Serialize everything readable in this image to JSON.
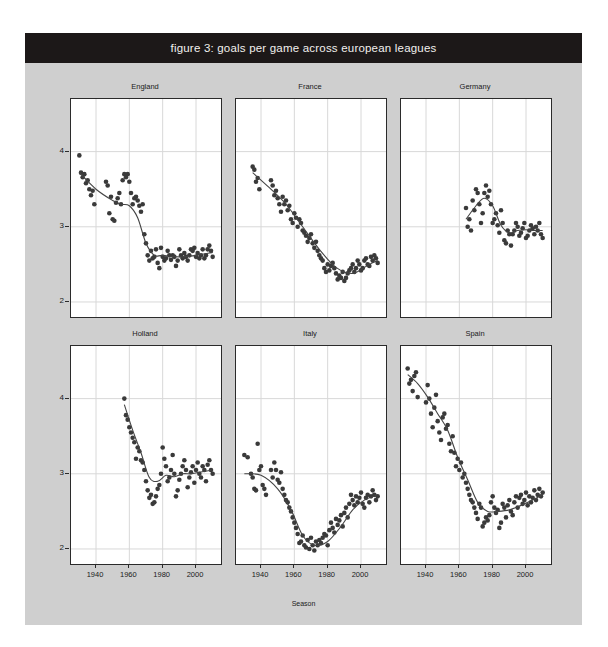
{
  "figure": {
    "title": "figure 3: goals per game across european leagues",
    "background_color": "#cfcfcf",
    "title_bar_color": "#1c1818",
    "title_text_color": "#f2f0ee",
    "panel_background": "#ffffff",
    "panel_border_color": "#2b2b2b",
    "grid_color": "#d8d8d8",
    "point_color": "#3a3a3a",
    "trend_line_color": "#444444"
  },
  "axes": {
    "xlabel": "Season",
    "ylabel": "Average goals per game",
    "yticks": [
      "4",
      "3",
      "2"
    ],
    "ytick_values": [
      4,
      3,
      2
    ],
    "xticks": [
      "1940",
      "1960",
      "1980",
      "2000"
    ],
    "xtick_values": [
      1940,
      1960,
      1980,
      2000
    ],
    "xlim": [
      1925,
      2015
    ],
    "ylim": [
      1.8,
      4.7
    ],
    "grid": true,
    "grid_axis": "both"
  },
  "panel_labels": [
    "England",
    "France",
    "Germany",
    "Holland",
    "Italy",
    "Spain"
  ],
  "chart_data": {
    "type": "scatter",
    "title": "figure 3: goals per game across european leagues",
    "xlabel": "Season",
    "ylabel": "Average goals per game",
    "xlim": [
      1925,
      2015
    ],
    "ylim": [
      1.8,
      4.7
    ],
    "xticks": [
      1940,
      1960,
      1980,
      2000
    ],
    "yticks": [
      2,
      3,
      4
    ],
    "grid": true,
    "legend": "none",
    "facet_layout": [
      3,
      2
    ],
    "series": [
      {
        "name": "England",
        "row": 0,
        "col": 0,
        "x": [
          1930,
          1931,
          1932,
          1933,
          1934,
          1935,
          1936,
          1937,
          1938,
          1939,
          1946,
          1947,
          1948,
          1949,
          1950,
          1951,
          1952,
          1953,
          1954,
          1955,
          1956,
          1957,
          1958,
          1959,
          1960,
          1961,
          1962,
          1963,
          1964,
          1965,
          1966,
          1967,
          1968,
          1969,
          1970,
          1971,
          1972,
          1973,
          1974,
          1975,
          1976,
          1977,
          1978,
          1979,
          1980,
          1981,
          1982,
          1983,
          1984,
          1985,
          1986,
          1987,
          1988,
          1989,
          1990,
          1991,
          1992,
          1993,
          1994,
          1995,
          1996,
          1997,
          1998,
          1999,
          2000,
          2001,
          2002,
          2003,
          2004,
          2005,
          2006,
          2007,
          2008,
          2009,
          2010
        ],
        "y": [
          3.95,
          3.72,
          3.66,
          3.7,
          3.58,
          3.62,
          3.5,
          3.42,
          3.48,
          3.3,
          3.6,
          3.55,
          3.18,
          3.4,
          3.1,
          3.08,
          3.32,
          3.38,
          3.45,
          3.3,
          3.62,
          3.7,
          3.66,
          3.7,
          3.6,
          3.45,
          3.3,
          3.38,
          3.4,
          3.35,
          3.28,
          3.2,
          3.3,
          2.9,
          2.78,
          2.62,
          2.55,
          2.68,
          2.58,
          2.6,
          2.7,
          2.52,
          2.45,
          2.72,
          2.6,
          2.55,
          2.58,
          2.68,
          2.62,
          2.56,
          2.62,
          2.6,
          2.48,
          2.55,
          2.7,
          2.62,
          2.58,
          2.65,
          2.6,
          2.55,
          2.62,
          2.7,
          2.68,
          2.72,
          2.6,
          2.65,
          2.58,
          2.62,
          2.7,
          2.58,
          2.62,
          2.7,
          2.75,
          2.68,
          2.6
        ],
        "trend": {
          "x": [
            1930,
            1940,
            1950,
            1955,
            1960,
            1965,
            1970,
            1975,
            1980,
            1990,
            2000,
            2010
          ],
          "y": [
            3.72,
            3.5,
            3.35,
            3.3,
            3.28,
            3.12,
            2.78,
            2.62,
            2.62,
            2.6,
            2.62,
            2.66
          ]
        }
      },
      {
        "name": "France",
        "row": 0,
        "col": 1,
        "x": [
          1935,
          1936,
          1937,
          1938,
          1939,
          1946,
          1947,
          1948,
          1949,
          1950,
          1951,
          1952,
          1953,
          1954,
          1955,
          1956,
          1957,
          1958,
          1959,
          1960,
          1961,
          1962,
          1963,
          1964,
          1965,
          1966,
          1967,
          1968,
          1969,
          1970,
          1971,
          1972,
          1973,
          1974,
          1975,
          1976,
          1977,
          1978,
          1979,
          1980,
          1981,
          1982,
          1983,
          1984,
          1985,
          1986,
          1987,
          1988,
          1989,
          1990,
          1991,
          1992,
          1993,
          1994,
          1995,
          1996,
          1997,
          1998,
          1999,
          2000,
          2001,
          2002,
          2003,
          2004,
          2005,
          2006,
          2007,
          2008,
          2009,
          2010
        ],
        "y": [
          3.8,
          3.76,
          3.6,
          3.65,
          3.5,
          3.62,
          3.55,
          3.42,
          3.48,
          3.38,
          3.3,
          3.2,
          3.4,
          3.3,
          3.35,
          3.22,
          3.28,
          3.1,
          3.05,
          3.18,
          3.12,
          3.0,
          3.1,
          3.05,
          2.95,
          2.92,
          2.88,
          2.8,
          2.85,
          2.9,
          2.78,
          2.72,
          2.8,
          2.68,
          2.62,
          2.58,
          2.55,
          2.45,
          2.4,
          2.5,
          2.42,
          2.48,
          2.52,
          2.45,
          2.38,
          2.3,
          2.35,
          2.32,
          2.4,
          2.28,
          2.32,
          2.38,
          2.42,
          2.45,
          2.5,
          2.4,
          2.45,
          2.55,
          2.5,
          2.42,
          2.45,
          2.55,
          2.58,
          2.5,
          2.48,
          2.6,
          2.55,
          2.62,
          2.58,
          2.52
        ],
        "trend": {
          "x": [
            1935,
            1945,
            1955,
            1965,
            1975,
            1985,
            1995,
            2005,
            2010
          ],
          "y": [
            3.72,
            3.52,
            3.3,
            3.0,
            2.7,
            2.46,
            2.38,
            2.5,
            2.55
          ]
        }
      },
      {
        "name": "Germany",
        "row": 0,
        "col": 2,
        "x": [
          1964,
          1965,
          1966,
          1967,
          1968,
          1969,
          1970,
          1971,
          1972,
          1973,
          1974,
          1975,
          1976,
          1977,
          1978,
          1979,
          1980,
          1981,
          1982,
          1983,
          1984,
          1985,
          1986,
          1987,
          1988,
          1989,
          1990,
          1991,
          1992,
          1993,
          1994,
          1995,
          1996,
          1997,
          1998,
          1999,
          2000,
          2001,
          2002,
          2003,
          2004,
          2005,
          2006,
          2007,
          2008,
          2009,
          2010
        ],
        "y": [
          3.25,
          3.0,
          3.1,
          2.95,
          3.35,
          3.22,
          3.5,
          3.45,
          3.3,
          3.05,
          3.18,
          3.45,
          3.55,
          3.4,
          3.48,
          3.3,
          3.05,
          3.1,
          3.18,
          3.02,
          2.92,
          3.22,
          3.05,
          2.82,
          2.78,
          2.95,
          2.9,
          2.75,
          2.9,
          2.95,
          3.05,
          3.0,
          2.88,
          2.92,
          2.98,
          3.05,
          2.85,
          2.88,
          2.95,
          3.02,
          2.98,
          2.9,
          3.0,
          2.95,
          3.05,
          2.9,
          2.85
        ],
        "trend": {
          "x": [
            1964,
            1970,
            1975,
            1980,
            1985,
            1990,
            1995,
            2000,
            2005,
            2010
          ],
          "y": [
            3.1,
            3.28,
            3.38,
            3.28,
            3.02,
            2.92,
            2.95,
            2.96,
            2.95,
            2.95
          ]
        }
      },
      {
        "name": "Holland",
        "row": 1,
        "col": 0,
        "x": [
          1957,
          1958,
          1959,
          1960,
          1961,
          1962,
          1963,
          1964,
          1965,
          1966,
          1967,
          1968,
          1969,
          1970,
          1971,
          1972,
          1973,
          1974,
          1975,
          1976,
          1977,
          1978,
          1979,
          1980,
          1981,
          1982,
          1983,
          1984,
          1985,
          1986,
          1987,
          1988,
          1989,
          1990,
          1991,
          1992,
          1993,
          1994,
          1995,
          1996,
          1997,
          1998,
          1999,
          2000,
          2001,
          2002,
          2003,
          2004,
          2005,
          2006,
          2007,
          2008,
          2009,
          2010
        ],
        "y": [
          4.0,
          3.78,
          3.72,
          3.62,
          3.55,
          3.48,
          3.42,
          3.2,
          3.35,
          3.3,
          3.18,
          3.15,
          3.05,
          2.9,
          2.78,
          2.68,
          2.72,
          2.6,
          2.62,
          2.7,
          2.8,
          2.85,
          3.0,
          3.35,
          3.2,
          3.1,
          2.9,
          2.95,
          3.05,
          3.25,
          3.0,
          2.7,
          2.78,
          2.92,
          3.0,
          3.1,
          3.18,
          3.05,
          2.82,
          2.95,
          3.02,
          3.1,
          2.88,
          3.05,
          3.15,
          3.0,
          2.95,
          3.1,
          3.05,
          2.9,
          3.12,
          3.18,
          3.05,
          3.0
        ],
        "trend": {
          "x": [
            1957,
            1962,
            1967,
            1972,
            1977,
            1982,
            1987,
            1992,
            1997,
            2002,
            2010
          ],
          "y": [
            3.92,
            3.58,
            3.28,
            2.95,
            2.9,
            2.98,
            2.96,
            3.0,
            3.0,
            3.02,
            3.05
          ]
        }
      },
      {
        "name": "Italy",
        "row": 1,
        "col": 1,
        "x": [
          1930,
          1932,
          1934,
          1935,
          1936,
          1937,
          1938,
          1939,
          1940,
          1941,
          1942,
          1943,
          1946,
          1947,
          1948,
          1949,
          1950,
          1951,
          1952,
          1953,
          1954,
          1955,
          1956,
          1957,
          1958,
          1959,
          1960,
          1961,
          1962,
          1963,
          1964,
          1965,
          1966,
          1967,
          1968,
          1969,
          1970,
          1971,
          1972,
          1973,
          1974,
          1975,
          1976,
          1977,
          1978,
          1979,
          1980,
          1981,
          1982,
          1983,
          1984,
          1985,
          1986,
          1987,
          1988,
          1989,
          1990,
          1991,
          1992,
          1993,
          1994,
          1995,
          1996,
          1997,
          1998,
          1999,
          2000,
          2001,
          2002,
          2003,
          2004,
          2005,
          2006,
          2007,
          2008,
          2009,
          2010
        ],
        "y": [
          3.25,
          3.22,
          3.0,
          2.95,
          2.8,
          2.78,
          3.4,
          3.05,
          3.1,
          2.85,
          2.8,
          2.72,
          3.05,
          2.95,
          3.15,
          3.05,
          2.92,
          2.88,
          3.02,
          2.8,
          2.72,
          2.65,
          2.62,
          2.55,
          2.5,
          2.42,
          2.35,
          2.28,
          2.2,
          2.08,
          2.1,
          2.18,
          2.05,
          2.02,
          2.12,
          2.0,
          2.15,
          2.05,
          1.98,
          2.1,
          2.05,
          2.12,
          2.08,
          2.15,
          2.2,
          2.18,
          2.05,
          2.25,
          2.35,
          2.28,
          2.22,
          2.4,
          2.32,
          2.38,
          2.45,
          2.3,
          2.48,
          2.55,
          2.42,
          2.6,
          2.72,
          2.65,
          2.58,
          2.7,
          2.62,
          2.68,
          2.75,
          2.6,
          2.55,
          2.68,
          2.72,
          2.62,
          2.7,
          2.78,
          2.72,
          2.65,
          2.7
        ],
        "trend": {
          "x": [
            1930,
            1940,
            1950,
            1958,
            1965,
            1972,
            1980,
            1988,
            1995,
            2002,
            2010
          ],
          "y": [
            3.0,
            2.98,
            2.8,
            2.52,
            2.18,
            2.05,
            2.1,
            2.3,
            2.52,
            2.65,
            2.72
          ]
        }
      },
      {
        "name": "Spain",
        "row": 1,
        "col": 2,
        "x": [
          1929,
          1930,
          1931,
          1932,
          1933,
          1934,
          1935,
          1940,
          1941,
          1942,
          1943,
          1944,
          1945,
          1946,
          1947,
          1948,
          1949,
          1950,
          1951,
          1952,
          1953,
          1954,
          1955,
          1956,
          1957,
          1958,
          1959,
          1960,
          1961,
          1962,
          1963,
          1964,
          1965,
          1966,
          1967,
          1968,
          1969,
          1970,
          1971,
          1972,
          1973,
          1974,
          1975,
          1976,
          1977,
          1978,
          1979,
          1980,
          1981,
          1982,
          1983,
          1984,
          1985,
          1986,
          1987,
          1988,
          1989,
          1990,
          1991,
          1992,
          1993,
          1994,
          1995,
          1996,
          1997,
          1998,
          1999,
          2000,
          2001,
          2002,
          2003,
          2004,
          2005,
          2006,
          2007,
          2008,
          2009,
          2010
        ],
        "y": [
          4.4,
          4.2,
          4.25,
          4.1,
          4.3,
          4.35,
          4.02,
          3.95,
          4.18,
          4.0,
          3.8,
          3.62,
          3.88,
          4.05,
          3.7,
          3.55,
          3.45,
          3.75,
          3.8,
          3.6,
          3.65,
          3.4,
          3.3,
          3.5,
          3.28,
          3.1,
          3.2,
          3.05,
          3.15,
          2.95,
          3.0,
          2.88,
          2.8,
          2.72,
          2.65,
          2.62,
          2.55,
          2.48,
          2.4,
          2.6,
          2.55,
          2.3,
          2.35,
          2.42,
          2.38,
          2.45,
          2.62,
          2.7,
          2.55,
          2.48,
          2.52,
          2.28,
          2.35,
          2.6,
          2.55,
          2.42,
          2.58,
          2.65,
          2.5,
          2.45,
          2.62,
          2.7,
          2.55,
          2.68,
          2.72,
          2.6,
          2.65,
          2.75,
          2.58,
          2.7,
          2.62,
          2.68,
          2.78,
          2.65,
          2.72,
          2.8,
          2.7,
          2.75
        ],
        "trend": {
          "x": [
            1929,
            1935,
            1941,
            1947,
            1953,
            1959,
            1965,
            1971,
            1977,
            1983,
            1990,
            1997,
            2004,
            2010
          ],
          "y": [
            4.32,
            4.2,
            4.02,
            3.8,
            3.58,
            3.22,
            2.92,
            2.62,
            2.5,
            2.5,
            2.52,
            2.58,
            2.65,
            2.72
          ]
        }
      }
    ]
  }
}
